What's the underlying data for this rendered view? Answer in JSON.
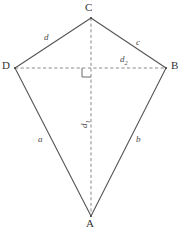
{
  "figure": {
    "shape_name": "kite",
    "width": 182,
    "height": 230,
    "background_color": "#ffffff",
    "solid_line_color": "#555555",
    "dashed_line_color": "#888888",
    "label_color": "#333333",
    "side_label_color": "#4a4a4a"
  },
  "vertices": {
    "top": {
      "label": "C",
      "x": 91,
      "y": 18
    },
    "left": {
      "label": "D",
      "x": 15,
      "y": 68
    },
    "right": {
      "label": "B",
      "x": 166,
      "y": 68
    },
    "bottom": {
      "label": "A",
      "x": 91,
      "y": 216
    }
  },
  "sides": {
    "upper_left": {
      "label": "d",
      "from": "C",
      "to": "D"
    },
    "upper_right": {
      "label": "c",
      "from": "C",
      "to": "B"
    },
    "lower_left": {
      "label": "a",
      "from": "D",
      "to": "A"
    },
    "lower_right": {
      "label": "b",
      "from": "B",
      "to": "A"
    }
  },
  "diagonals": {
    "horizontal": {
      "label": "d",
      "subscript": "2",
      "from": "D",
      "to": "B",
      "style": "dashed"
    },
    "vertical": {
      "label": "d",
      "subscript": "1",
      "from": "C",
      "to": "A",
      "style": "dashed",
      "rotated": true
    }
  },
  "right_angle_marker": {
    "name": "right-angle-marker",
    "x": 91,
    "y": 68,
    "size": 9
  }
}
